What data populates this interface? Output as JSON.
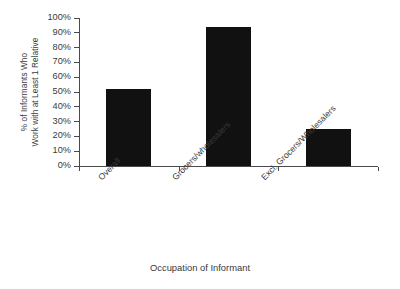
{
  "chart_data": {
    "type": "bar",
    "title": "",
    "xlabel": "Occupation of Informant",
    "ylabel": "% of Informants Who Work with at Least 1 Relative",
    "ylabel_lines": [
      "% of Informants Who",
      "Work with at Least 1 Relative"
    ],
    "categories": [
      "Overall",
      "Grocers/wholesalers",
      "Excl. Grocers/Wholesalers"
    ],
    "values": [
      52,
      94,
      25
    ],
    "value_unit": "%",
    "ylim": [
      0,
      100
    ],
    "ytick_values": [
      0,
      10,
      20,
      30,
      40,
      50,
      60,
      70,
      80,
      90,
      100
    ],
    "ytick_labels": [
      "0%",
      "10%",
      "20%",
      "30%",
      "40%",
      "50%",
      "60%",
      "70%",
      "80%",
      "90%",
      "100%"
    ],
    "grid": false,
    "legend": null,
    "bar_color": "#111111",
    "axis_color": "#4a4a4a",
    "text_color": "#3a3a3a",
    "background_color": "#ffffff",
    "category_label_rotation_deg": -45
  }
}
